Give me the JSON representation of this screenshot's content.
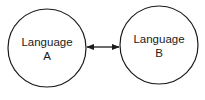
{
  "diagram": {
    "nodes": [
      {
        "id": "a",
        "line1": "Language",
        "line2": "A"
      },
      {
        "id": "b",
        "line1": "Language",
        "line2": "B"
      }
    ],
    "edges": [
      {
        "from": "a",
        "to": "b",
        "direction": "bidirectional"
      }
    ],
    "colors": {
      "stroke": "#1a1a1a",
      "fill": "#ffffff"
    }
  }
}
